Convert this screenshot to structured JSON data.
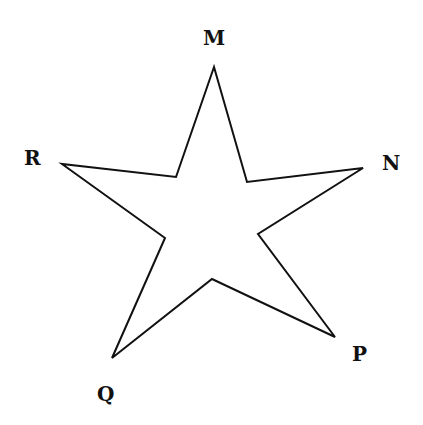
{
  "diagram": {
    "type": "five-pointed star",
    "labels": {
      "top": "M",
      "right": "N",
      "bottom_right": "P",
      "bottom_left": "Q",
      "left": "R"
    },
    "vertex_order": [
      "M",
      "N",
      "P",
      "Q",
      "R"
    ]
  }
}
